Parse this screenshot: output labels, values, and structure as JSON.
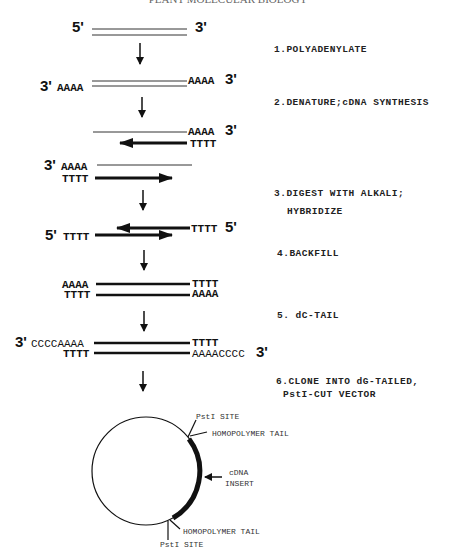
{
  "title": "PLANT MOLECULAR BIOLOGY",
  "steps": [
    {
      "label": "1.POLYADENYLATE"
    },
    {
      "label": "2.DENATURE;cDNA  SYNTHESIS"
    },
    {
      "label_line1": "3.DIGEST  WITH  ALKALI;",
      "label_line2": "HYBRIDIZE"
    },
    {
      "label": "4.BACKFILL"
    },
    {
      "label": "5. dC-TAIL"
    },
    {
      "label_line1": "6.CLONE  INTO  dG-TAILED,",
      "label_line2": "PstI-CUT  VECTOR"
    }
  ],
  "stage0": {
    "left_end": "5'",
    "right_end": "3'"
  },
  "stage1": {
    "left_end": "3'",
    "left_seq": "AAAA",
    "right_seq": "AAAA",
    "right_end": "3'"
  },
  "stage2": {
    "top_right_seq": "AAAA",
    "top_right_end": "3'",
    "bottom_right_seq": "TTTT"
  },
  "stage3": {
    "left_end": "3'",
    "top_left_seq": "AAAA",
    "bottom_left_seq": "TTTT"
  },
  "stage4": {
    "left_end": "5'",
    "left_seq": "TTTT",
    "right_seq": "TTTT",
    "right_end": "5'"
  },
  "stage5": {
    "top_left": "AAAA",
    "bottom_left": "TTTT",
    "top_right": "TTTT",
    "bottom_right": "AAAA"
  },
  "stage6": {
    "left_end": "3'",
    "top_left": "CCCCAAAA",
    "bottom_left": "TTTT",
    "top_right": "TTTT",
    "bottom_right": "AAAACCCC",
    "right_end": "3'"
  },
  "plasmid": {
    "pst_site_top": "PstI SITE",
    "tail_top": "HOMOPOLYMER TAIL",
    "insert_line1": "cDNA",
    "insert_line2": "INSERT",
    "tail_bottom": "HOMOPOLYMER TAIL",
    "pst_site_bottom": "PstI SITE"
  }
}
